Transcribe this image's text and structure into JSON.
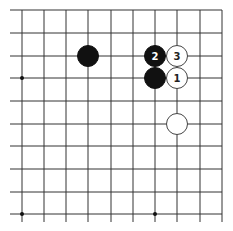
{
  "diagram": {
    "type": "go-board-fragment",
    "grid": {
      "x_lines": [
        22,
        44,
        66,
        88,
        111,
        133,
        155,
        177,
        200,
        222
      ],
      "y_lines": [
        10,
        33,
        56,
        78,
        101,
        124,
        146,
        169,
        192,
        214
      ],
      "line_color": "#333333",
      "x_extend_left": 10,
      "y_extend_bottom": 222
    },
    "star_points": [
      {
        "col": 0,
        "row": 3
      },
      {
        "col": 0,
        "row": 9
      },
      {
        "col": 6,
        "row": 9
      }
    ],
    "stones": [
      {
        "color": "black",
        "col": 3,
        "row": 2,
        "label": ""
      },
      {
        "color": "black",
        "col": 6,
        "row": 2,
        "label": "2"
      },
      {
        "color": "black",
        "col": 6,
        "row": 3,
        "label": ""
      },
      {
        "color": "white",
        "col": 7,
        "row": 2,
        "label": "3"
      },
      {
        "color": "white",
        "col": 7,
        "row": 3,
        "label": "1"
      },
      {
        "color": "white",
        "col": 7,
        "row": 5,
        "label": ""
      }
    ],
    "colors": {
      "black_stone": "#111111",
      "white_stone": "#ffffff",
      "white_stroke": "#444444",
      "black_label": "#ffffff",
      "white_label": "#222222"
    }
  }
}
